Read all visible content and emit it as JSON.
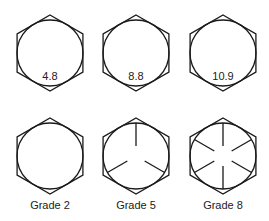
{
  "metric_row": {
    "items": [
      {
        "label": "4.8",
        "cx": 50,
        "cy": 53
      },
      {
        "label": "8.8",
        "cx": 136,
        "cy": 53
      },
      {
        "label": "10.9",
        "cx": 223,
        "cy": 53
      }
    ]
  },
  "sae_row": {
    "items": [
      {
        "label": "Grade 2",
        "cx": 50,
        "cy": 156,
        "radial_lines": 0
      },
      {
        "label": "Grade 5",
        "cx": 136,
        "cy": 156,
        "radial_lines": 3
      },
      {
        "label": "Grade 8",
        "cx": 223,
        "cy": 156,
        "radial_lines": 6
      }
    ]
  },
  "geometry": {
    "hex_radius": 38,
    "circle_radius": 33,
    "mark_inner_radius": 10
  },
  "colors": {
    "stroke": "#1a1a1a",
    "text": "#222222",
    "background": "#ffffff"
  }
}
